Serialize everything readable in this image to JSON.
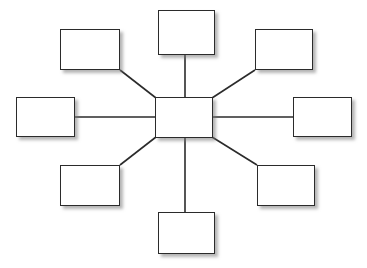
{
  "diagram": {
    "type": "hub-and-spoke",
    "background_color": "#ffffff",
    "border_color": "#2b2b2b",
    "shadow_color": "#787878",
    "connector_color": "#2b2b2b",
    "canvas": {
      "width": 367,
      "height": 268
    },
    "hub": {
      "id": "hub",
      "label": "",
      "x": 155,
      "y": 97,
      "width": 58,
      "height": 41
    },
    "nodes": [
      {
        "id": "node-top-left",
        "name": "top-left",
        "label": "",
        "x": 60,
        "y": 29,
        "width": 60,
        "height": 41
      },
      {
        "id": "node-top-center",
        "name": "top-center",
        "label": "",
        "x": 158,
        "y": 10,
        "width": 57,
        "height": 45
      },
      {
        "id": "node-top-right",
        "name": "top-right",
        "label": "",
        "x": 255,
        "y": 29,
        "width": 58,
        "height": 41
      },
      {
        "id": "node-middle-left",
        "name": "middle-left",
        "label": "",
        "x": 16,
        "y": 97,
        "width": 59,
        "height": 40
      },
      {
        "id": "node-middle-right",
        "name": "middle-right",
        "label": "",
        "x": 293,
        "y": 97,
        "width": 59,
        "height": 40
      },
      {
        "id": "node-bottom-left",
        "name": "bottom-left",
        "label": "",
        "x": 60,
        "y": 165,
        "width": 60,
        "height": 41
      },
      {
        "id": "node-bottom-center",
        "name": "bottom-center",
        "label": "",
        "x": 158,
        "y": 212,
        "width": 57,
        "height": 42
      },
      {
        "id": "node-bottom-right",
        "name": "bottom-right",
        "label": "",
        "x": 257,
        "y": 165,
        "width": 58,
        "height": 41
      }
    ],
    "connectors": [
      {
        "id": "connector-hub-top-left",
        "from": "hub",
        "to": "node-top-left",
        "x1": 156,
        "y1": 98,
        "x2": 120,
        "y2": 70
      },
      {
        "id": "connector-hub-top-center",
        "from": "hub",
        "to": "node-top-center",
        "x1": 185,
        "y1": 97,
        "x2": 185,
        "y2": 55
      },
      {
        "id": "connector-hub-top-right",
        "from": "hub",
        "to": "node-top-right",
        "x1": 212,
        "y1": 98,
        "x2": 255,
        "y2": 70
      },
      {
        "id": "connector-hub-middle-left",
        "from": "hub",
        "to": "node-middle-left",
        "x1": 155,
        "y1": 117,
        "x2": 75,
        "y2": 117
      },
      {
        "id": "connector-hub-middle-right",
        "from": "hub",
        "to": "node-middle-right",
        "x1": 213,
        "y1": 117,
        "x2": 293,
        "y2": 117
      },
      {
        "id": "connector-hub-bottom-left",
        "from": "hub",
        "to": "node-bottom-left",
        "x1": 156,
        "y1": 137,
        "x2": 120,
        "y2": 165
      },
      {
        "id": "connector-hub-bottom-center",
        "from": "hub",
        "to": "node-bottom-center",
        "x1": 185,
        "y1": 138,
        "x2": 185,
        "y2": 212
      },
      {
        "id": "connector-hub-bottom-right",
        "from": "hub",
        "to": "node-bottom-right",
        "x1": 212,
        "y1": 137,
        "x2": 257,
        "y2": 165
      }
    ]
  }
}
